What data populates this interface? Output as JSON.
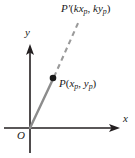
{
  "figure": {
    "type": "coordinate-diagram",
    "canvas": {
      "width": 135,
      "height": 158,
      "background": "#ffffff"
    },
    "axes": {
      "x_label": "x",
      "y_label": "y",
      "origin_label": "O",
      "origin_px": {
        "x": 30,
        "y": 128
      },
      "x_axis_px": {
        "x1": 4,
        "y1": 128,
        "x2": 120,
        "y2": 128
      },
      "y_axis_px": {
        "x1": 30,
        "y1": 153,
        "x2": 30,
        "y2": 44
      },
      "axis_color": "#231f20",
      "arrowheads": [
        "x-positive",
        "y-positive"
      ]
    },
    "points": [
      {
        "id": "P",
        "label": "P(x_p, y_p)",
        "label_parts": {
          "name": "P",
          "open": "(",
          "x": "x",
          "xsub": "p",
          "comma": ", ",
          "y": "y",
          "ysub": "p",
          "close": ")"
        },
        "marker": "filled-dot",
        "marker_color": "#1a1a1a",
        "px": {
          "x": 53,
          "y": 78
        }
      },
      {
        "id": "P-prime",
        "label": "P'(kx_p, ky_p)",
        "label_parts": {
          "name": "P",
          "prime": "'",
          "open": "(",
          "k1": "k",
          "x": "x",
          "xsub": "p",
          "comma": ", ",
          "k2": "k",
          "y": "y",
          "ysub": "p",
          "close": ")"
        },
        "marker": "none",
        "px": {
          "x": 78,
          "y": 20
        }
      }
    ],
    "segments": [
      {
        "id": "ray-origin-to-P",
        "style": "solid",
        "color": "#8c8c8c",
        "width": 2.2,
        "from_px": {
          "x": 30,
          "y": 128
        },
        "to_px": {
          "x": 53,
          "y": 78
        }
      },
      {
        "id": "ray-P-to-Pprime",
        "style": "dashed",
        "color": "#9a9a9a",
        "width": 2.0,
        "dash": "5 4",
        "from_px": {
          "x": 53,
          "y": 78
        },
        "to_px": {
          "x": 79,
          "y": 21
        }
      }
    ],
    "colors": {
      "ink": "#231f20",
      "ray_solid": "#8c8c8c",
      "ray_dashed": "#9a9a9a",
      "background": "#ffffff"
    }
  }
}
